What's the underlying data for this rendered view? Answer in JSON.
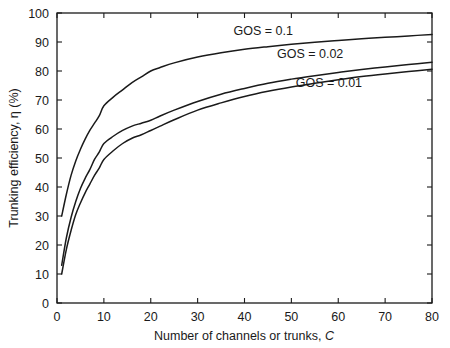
{
  "chart_data": {
    "type": "line",
    "title": "",
    "xlabel": "Number of channels or trunks, C",
    "xlabel_plain": "Number of channels or trunks, ",
    "xlabel_italic": "C",
    "ylabel": "Trunking efficiency, η (%)",
    "xlim": [
      0,
      80
    ],
    "ylim": [
      0,
      100
    ],
    "xticks": [
      0,
      10,
      20,
      30,
      40,
      50,
      60,
      70,
      80
    ],
    "yticks": [
      0,
      10,
      20,
      30,
      40,
      50,
      60,
      70,
      80,
      90,
      100
    ],
    "xtick_labels": [
      "0",
      "10",
      "20",
      "30",
      "40",
      "50",
      "60",
      "70",
      "80"
    ],
    "ytick_labels": [
      "0",
      "10",
      "20",
      "30",
      "40",
      "50",
      "60",
      "70",
      "80",
      "90",
      "100"
    ],
    "grid": false,
    "legend_position": "inline-annotations",
    "line_color": "#1a1a1a",
    "series": [
      {
        "name": "GOS = 0.1",
        "annotation": "GOS = 0.1",
        "annotation_x": 44,
        "annotation_y": 94,
        "x": [
          1,
          2,
          3,
          4,
          5,
          6,
          7,
          8,
          9,
          10,
          12,
          14,
          16,
          18,
          20,
          22,
          25,
          30,
          35,
          40,
          45,
          50,
          55,
          60,
          65,
          70,
          75,
          80
        ],
        "y": [
          30,
          37.5,
          44,
          49,
          53,
          56.5,
          59.5,
          62,
          64.5,
          68,
          71,
          73.5,
          76,
          78,
          80,
          81.2,
          82.8,
          84.8,
          86.3,
          87.5,
          88.4,
          89.2,
          89.9,
          90.5,
          91.1,
          91.6,
          92.1,
          92.6
        ]
      },
      {
        "name": "GOS = 0.02",
        "annotation": "GOS = 0.02",
        "annotation_x": 54,
        "annotation_y": 86,
        "x": [
          1,
          2,
          3,
          4,
          5,
          6,
          7,
          8,
          9,
          10,
          12,
          14,
          16,
          18,
          20,
          22,
          25,
          30,
          35,
          40,
          45,
          50,
          55,
          60,
          65,
          70,
          75,
          80
        ],
        "y": [
          13,
          22.5,
          29.5,
          35,
          39.5,
          43,
          46,
          49.5,
          52,
          55,
          57.5,
          59.5,
          61,
          62,
          63,
          64.5,
          66.5,
          69.5,
          72,
          74,
          75.8,
          77.2,
          78.4,
          79.5,
          80.5,
          81.4,
          82.2,
          83
        ],
        "_note_endpoint": 84
      },
      {
        "name": "GOS = 0.01",
        "annotation": "GOS = 0.01",
        "annotation_x": 58,
        "annotation_y": 76,
        "x": [
          1,
          2,
          3,
          4,
          5,
          6,
          7,
          8,
          9,
          10,
          12,
          14,
          16,
          18,
          20,
          22,
          25,
          30,
          35,
          40,
          45,
          50,
          55,
          60,
          65,
          70,
          75,
          80
        ],
        "y": [
          10,
          18.5,
          25,
          30.5,
          34.5,
          38,
          41,
          44,
          46.5,
          49.5,
          52.5,
          55,
          56.8,
          58,
          59.5,
          61,
          63.2,
          66.5,
          69,
          71.2,
          73,
          74.5,
          75.8,
          77,
          78.1,
          79,
          79.8,
          80.6
        ],
        "_note_endpoint": 82
      }
    ]
  }
}
